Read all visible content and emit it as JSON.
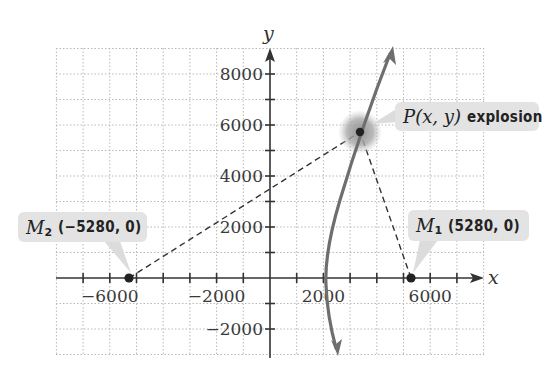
{
  "axes": {
    "x_label": "x",
    "y_label": "y",
    "x_tick_labels": [
      {
        "value": -6000,
        "label": "−6000"
      },
      {
        "value": -2000,
        "label": "−2000"
      },
      {
        "value": 2000,
        "label": "2000"
      },
      {
        "value": 6000,
        "label": "6000"
      }
    ],
    "y_tick_labels": [
      {
        "value": 8000,
        "label": "8000"
      },
      {
        "value": 6000,
        "label": "6000"
      },
      {
        "value": 4000,
        "label": "4000"
      },
      {
        "value": 2000,
        "label": "2000"
      },
      {
        "value": -2000,
        "label": "−2000"
      }
    ],
    "x_range": [
      -8000,
      8000
    ],
    "y_range": [
      -3000,
      9000
    ],
    "grid_step": 1000
  },
  "points": {
    "M1": {
      "name": "M",
      "subscript": "1",
      "coords": "(5280, 0)",
      "x": 5280,
      "y": 0
    },
    "M2": {
      "name": "M",
      "subscript": "2",
      "coords": "(−5280, 0)",
      "x": -5280,
      "y": 0
    },
    "P": {
      "name": "P",
      "args": "(x, y)",
      "caption": "explosion",
      "x": 3370,
      "y": 5725
    }
  },
  "colors": {
    "grid": "#b8b8b8",
    "axis": "#333333",
    "curve": "#6e6e6e",
    "callout_bg": "#e3e3e3",
    "glow": "#9a9a9a",
    "point": "#222222"
  }
}
